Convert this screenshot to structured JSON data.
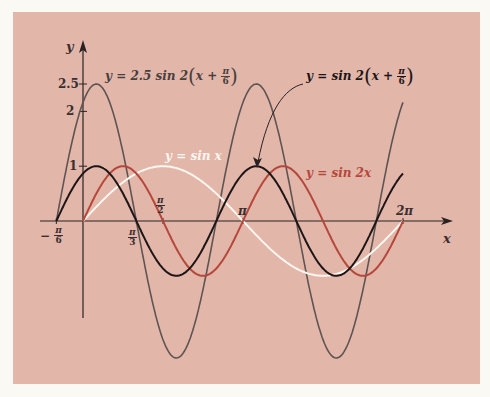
{
  "chart_data": {
    "type": "line",
    "title": "",
    "xlabel": "x",
    "ylabel": "y",
    "xlim": [
      -0.5236,
      6.2832
    ],
    "ylim": [
      -2.5,
      2.5
    ],
    "grid": false,
    "x_ticks": [
      {
        "value": -0.5236,
        "label_num": "π",
        "label_den": "6",
        "sign": "−"
      },
      {
        "value": 1.0472,
        "label_num": "π",
        "label_den": "3",
        "sign": ""
      },
      {
        "value": 1.5708,
        "label_num": "π",
        "label_den": "2",
        "sign": ""
      },
      {
        "value": 3.1416,
        "label": "π"
      },
      {
        "value": 6.2832,
        "label": "2π"
      }
    ],
    "y_ticks": [
      {
        "value": 1,
        "label": "1"
      },
      {
        "value": 2,
        "label": "2"
      },
      {
        "value": 2.5,
        "label": "2.5"
      }
    ],
    "series": [
      {
        "name": "y = sin x",
        "expr": "sin(x)",
        "amplitude": 1,
        "frequency": 1,
        "phase_shift": 0,
        "x_range": [
          0,
          6.2832
        ],
        "color": "#fbf7ef"
      },
      {
        "name": "y = sin 2x",
        "expr": "sin(2x)",
        "amplitude": 1,
        "frequency": 2,
        "phase_shift": 0,
        "x_range": [
          0,
          6.2832
        ],
        "color": "#b5473a"
      },
      {
        "name": "y = sin 2(x + π/6)",
        "expr": "sin(2(x+π/6))",
        "amplitude": 1,
        "frequency": 2,
        "phase_shift": 0.5236,
        "x_range": [
          -0.5236,
          6.2832
        ],
        "color": "#1e1616"
      },
      {
        "name": "y = 2.5 sin 2(x + π/6)",
        "expr": "2.5 sin(2(x+π/6))",
        "amplitude": 2.5,
        "frequency": 2,
        "phase_shift": 0.5236,
        "x_range": [
          -0.5236,
          6.2832
        ],
        "color": "#5e5452"
      }
    ],
    "annotations": [
      {
        "text": "y = 2.5 sin 2(x + π/6)",
        "target_series": 3
      },
      {
        "text": "y = sin 2(x + π/6)",
        "target_series": 2,
        "arrow": true
      },
      {
        "text": "y = sin x",
        "target_series": 0
      },
      {
        "text": "y = sin 2x",
        "target_series": 1
      }
    ]
  },
  "labels": {
    "y_axis": "y",
    "x_axis": "x",
    "tick_1": "1",
    "tick_2": "2",
    "tick_25": "2.5",
    "pi": "π",
    "two_pi": "2π",
    "six": "6",
    "three": "3",
    "two": "2",
    "minus": "−",
    "ann_gray_prefix": "y = 2.5 sin 2",
    "ann_black_prefix": "y = sin 2",
    "ann_x_plus": "x +",
    "open_paren": "(",
    "close_paren": ")",
    "ann_white": "y = sin x",
    "ann_red": "y = sin 2x"
  },
  "layout": {
    "origin_px": [
      83,
      221
    ],
    "x_scale_px_per_unit": 50.93,
    "y_scale_px_per_unit": 54.8
  }
}
